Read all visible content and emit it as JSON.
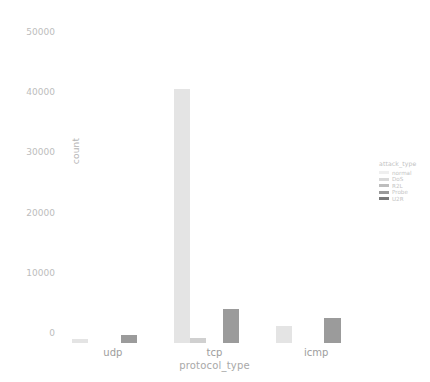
{
  "chart_data": {
    "type": "bar",
    "title": "",
    "xlabel": "protocol_type",
    "ylabel": "count",
    "categories": [
      "udp",
      "tcp",
      "icmp"
    ],
    "ylim": [
      0,
      54000
    ],
    "yticks": [
      0,
      10000,
      20000,
      30000,
      40000,
      50000
    ],
    "ytick_labels": [
      "0",
      "10000",
      "20000",
      "30000",
      "40000",
      "50000"
    ],
    "grid": false,
    "legend": {
      "title": "attack_type",
      "position": "right",
      "entries": [
        {
          "label": "normal",
          "color": "#efefef"
        },
        {
          "label": "DoS",
          "color": "#d9d9d9"
        },
        {
          "label": "R2L",
          "color": "#bdbdbd"
        },
        {
          "label": "Probe",
          "color": "#9a9a9a"
        },
        {
          "label": "U2R",
          "color": "#7a7a7a"
        }
      ]
    },
    "series": [
      {
        "name": "normal",
        "color": "#e4e4e4",
        "values": [
          600,
          42200,
          2800
        ]
      },
      {
        "name": "DoS",
        "color": "#d0d0d0",
        "values": [
          0,
          900,
          0
        ]
      },
      {
        "name": "R2L",
        "color": "#bdbdbd",
        "values": [
          0,
          0,
          0
        ]
      },
      {
        "name": "Probe",
        "color": "#9b9b9b",
        "values": [
          1400,
          5700,
          4200
        ]
      },
      {
        "name": "U2R",
        "color": "#7a7a7a",
        "values": [
          0,
          0,
          0
        ]
      }
    ]
  }
}
